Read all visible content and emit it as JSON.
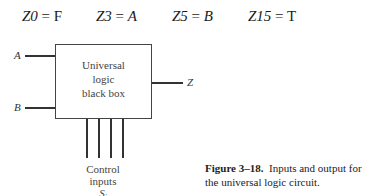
{
  "equations": [
    {
      "lhs": "Z0",
      "rhs": "F",
      "rhs_italic": false
    },
    {
      "lhs": "Z3",
      "rhs": "A",
      "rhs_italic": true
    },
    {
      "lhs": "Z5",
      "rhs": "B",
      "rhs_italic": true
    },
    {
      "lhs": "Z15",
      "rhs": "T",
      "rhs_italic": false
    }
  ],
  "equals": "=",
  "diagram": {
    "box_lines": [
      "Universal",
      "logic",
      "black box"
    ],
    "input_a": "A",
    "input_b": "B",
    "output": "Z",
    "control_lines": [
      "Control",
      "inputs",
      "S"
    ],
    "control_subscript": "i"
  },
  "caption": {
    "label": "Figure 3–18.",
    "text": "Inputs and output for the universal logic circuit."
  }
}
